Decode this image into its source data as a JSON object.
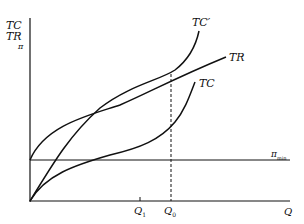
{
  "axes": {
    "y_label_lines": [
      "TC",
      "TR",
      "π"
    ],
    "x_label": "Q"
  },
  "curves": {
    "tc_prime": "TC′",
    "tr": "TR",
    "tc": "TC"
  },
  "lines": {
    "pi_min": "π",
    "pi_min_sub": "min"
  },
  "x_ticks": {
    "q1": "Q",
    "q1_sub": "1",
    "q0": "Q",
    "q0_sub": "0"
  },
  "colors": {
    "ink": "#111111",
    "background": "#ffffff"
  }
}
